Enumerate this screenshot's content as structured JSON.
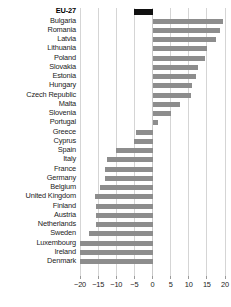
{
  "chart_data": {
    "type": "bar",
    "orientation": "horizontal",
    "title": "",
    "subtitle": "",
    "xlabel": "",
    "ylabel": "",
    "xlim": [
      -20,
      20
    ],
    "xticks": [
      -20,
      -15,
      -10,
      -5,
      0,
      5,
      10,
      15,
      20
    ],
    "xtick_labels": [
      "−20",
      "−15",
      "−10",
      "−5",
      "0",
      "5",
      "10",
      "15",
      "20"
    ],
    "grid": true,
    "legend": "none",
    "zero_reference_line": 0,
    "categories": [
      "EU-27",
      "Bulgaria",
      "Romania",
      "Latvia",
      "Lithuania",
      "Poland",
      "Slovakia",
      "Estonia",
      "Hungary",
      "Czech Republic",
      "Malta",
      "Slovenia",
      "Portugal",
      "Greece",
      "Cyprus",
      "Spain",
      "Italy",
      "France",
      "Germany",
      "Belgium",
      "United Kingdom",
      "Finland",
      "Austria",
      "Netherlands",
      "Sweden",
      "Luxembourg",
      "Ireland",
      "Denmark"
    ],
    "values": [
      -5.0,
      19.5,
      18.5,
      17.5,
      15.0,
      14.5,
      12.5,
      12.0,
      11.0,
      10.5,
      7.5,
      5.0,
      1.5,
      -4.5,
      -5.0,
      -10.0,
      -12.5,
      -13.0,
      -13.0,
      -14.5,
      -16.0,
      -15.5,
      -15.5,
      -15.5,
      -17.5,
      -20.0,
      -20.0,
      -20.0
    ],
    "highlight_category": "EU-27",
    "colors": {
      "bar": "#8d8d8d",
      "highlight_bar": "#111111",
      "gridline": "#d5d5d5",
      "text": "#1b1b1b",
      "background": "#ffffff"
    }
  }
}
